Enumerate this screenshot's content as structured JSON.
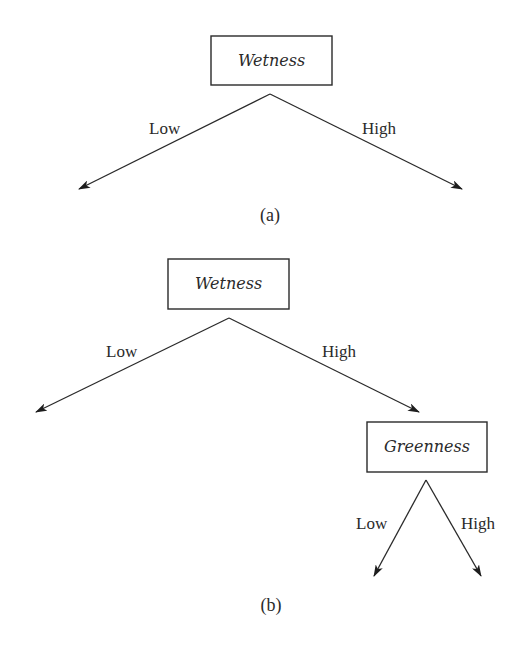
{
  "diagram_a": {
    "root": {
      "label": "Wetness"
    },
    "edges": [
      {
        "label": "Low"
      },
      {
        "label": "High"
      }
    ],
    "caption": "(a)"
  },
  "diagram_b": {
    "root": {
      "label": "Wetness"
    },
    "edges": [
      {
        "label": "Low"
      },
      {
        "label": "High"
      }
    ],
    "child": {
      "label": "Greenness",
      "edges": [
        {
          "label": "Low"
        },
        {
          "label": "High"
        }
      ]
    },
    "caption": "(b)"
  },
  "colors": {
    "stroke": "#2a2a2a",
    "background": "#ffffff"
  }
}
